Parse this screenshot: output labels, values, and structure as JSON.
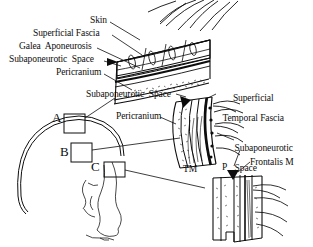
{
  "figure": {
    "type": "anatomical-illustration",
    "style": "black-and-white line drawing",
    "ink_color": "#0d0d0d",
    "background_color": "#ffffff"
  },
  "labels": {
    "skin": "Skin",
    "superficial_fascia": "Superficial Fascia",
    "galea_aponeurosis": "Galea  Aponeurosis",
    "subaponeurotic_space_1": "Subaponeurotic  Space",
    "pericranium_1": "Pericranium",
    "subaponeurotic_space_2": "Subaponeurotic  Space",
    "pericranium_2": "Pericranium",
    "superficial_temporal_fascia_line1": "Superficial",
    "superficial_temporal_fascia_line2": "Temporal Fascia",
    "subaponeurotic_space_3_line1": "Subaponeurotic",
    "subaponeurotic_space_3_line2": "Space",
    "frontalis_muscle": "Frontalis M",
    "tm_abbreviation": "TM",
    "p_abbreviation": "P"
  },
  "callout_boxes": {
    "a": "A",
    "b": "B",
    "c": "C"
  }
}
